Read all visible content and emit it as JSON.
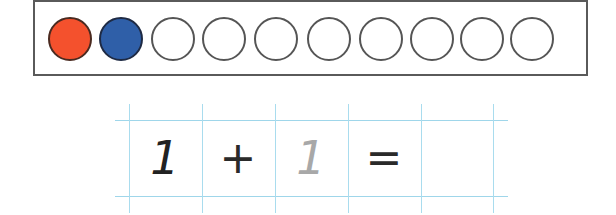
{
  "ten_frame": {
    "total_circles": 10,
    "circles": [
      {
        "fill": "red",
        "color": "#f4512d"
      },
      {
        "fill": "blue",
        "color": "#2f5fa8"
      },
      {
        "fill": "empty"
      },
      {
        "fill": "empty"
      },
      {
        "fill": "empty"
      },
      {
        "fill": "empty"
      },
      {
        "fill": "empty"
      },
      {
        "fill": "empty"
      },
      {
        "fill": "empty"
      },
      {
        "fill": "empty"
      }
    ]
  },
  "equation": {
    "cells": [
      {
        "text": "1",
        "style": "dark"
      },
      {
        "text": "+",
        "style": "operator"
      },
      {
        "text": "1",
        "style": "faint"
      },
      {
        "text": "=",
        "style": "operator"
      },
      {
        "text": "",
        "style": "blank"
      }
    ]
  },
  "colors": {
    "grid_line": "#a9dcee",
    "frame_border": "#5a5a5a",
    "red": "#f4512d",
    "blue": "#2f5fa8"
  }
}
